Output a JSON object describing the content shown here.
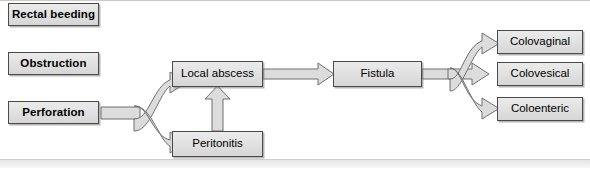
{
  "diagram": {
    "background_color": "#ffffff",
    "box_fill_color": "#e2e2e2",
    "box_border_color": "#4a4a4a",
    "arrow_fill_color": "#dcdcdc",
    "arrow_border_color": "#6e6e6e",
    "causes": [
      {
        "id": "rectal-bleeding",
        "label": "Rectal beeding"
      },
      {
        "id": "obstruction",
        "label": "Obstruction"
      },
      {
        "id": "perforation",
        "label": "Perforation"
      }
    ],
    "stages": [
      {
        "id": "local-abscess",
        "label": "Local abscess"
      },
      {
        "id": "peritonitis",
        "label": "Peritonitis"
      },
      {
        "id": "fistula",
        "label": "Fistula"
      }
    ],
    "outcomes": [
      {
        "id": "colovaginal",
        "label": "Colovaginal"
      },
      {
        "id": "colovesical",
        "label": "Colovesical"
      },
      {
        "id": "coloenteric",
        "label": "Coloenteric"
      }
    ],
    "connections": [
      {
        "from": "perforation",
        "to": "local-abscess"
      },
      {
        "from": "perforation",
        "to": "peritonitis"
      },
      {
        "from": "peritonitis",
        "to": "local-abscess"
      },
      {
        "from": "local-abscess",
        "to": "fistula"
      },
      {
        "from": "fistula",
        "to": "colovaginal"
      },
      {
        "from": "fistula",
        "to": "colovesical"
      },
      {
        "from": "fistula",
        "to": "coloenteric"
      }
    ]
  }
}
